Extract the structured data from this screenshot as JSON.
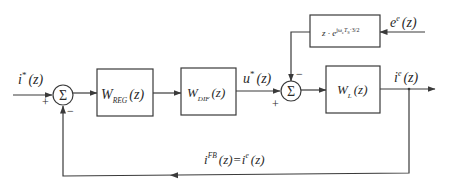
{
  "diagram": {
    "type": "control-block-diagram",
    "colors": {
      "line": "#3a3a3a",
      "text": "#2a2a2a",
      "background": "#ffffff"
    },
    "signals": {
      "reference": {
        "base": "i",
        "sup": "*",
        "arg": "(z)"
      },
      "control": {
        "base": "u",
        "sup": "*",
        "arg": "(z)"
      },
      "output": {
        "base": "i",
        "sup": "e",
        "arg": "(z)"
      },
      "disturbance": {
        "base": "e",
        "sup": "e",
        "arg": "(z)"
      },
      "feedback": {
        "lhs_base": "i",
        "lhs_sup": "FB",
        "lhs_arg": "(z)",
        "eq": "=",
        "rhs_base": "i",
        "rhs_sup": "e",
        "rhs_arg": "(z)"
      }
    },
    "blocks": {
      "regulator": {
        "base": "W",
        "sub": "REG",
        "arg": "(z)"
      },
      "dif": {
        "base": "W",
        "sub": "DIF",
        "arg": "(z)"
      },
      "plant": {
        "base": "W",
        "sub": "L",
        "arg": "(z)"
      },
      "delay": {
        "base": "z · e",
        "sup": "jω",
        "sup_sub": "e",
        "sup_rest": "T",
        "sup_rest_sub": "S",
        "sup_tail": "·3/2"
      }
    },
    "summers": {
      "sum1": {
        "symbol": "Σ",
        "plus": "+",
        "minus": "−"
      },
      "sum2": {
        "symbol": "Σ",
        "plus": "+",
        "minus": "−"
      }
    }
  }
}
